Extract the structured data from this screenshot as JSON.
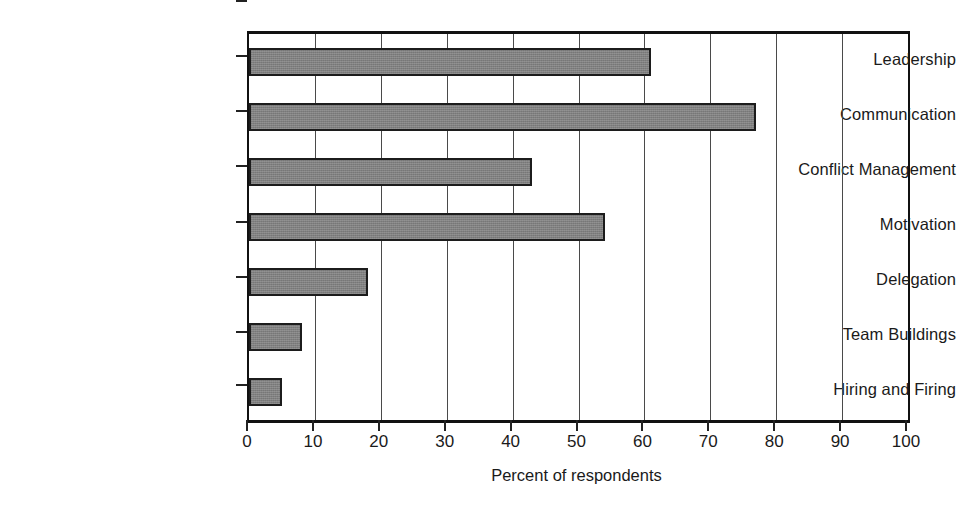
{
  "chart_data": {
    "type": "bar",
    "orientation": "horizontal",
    "title": "",
    "subtitle": "",
    "xlabel": "Percent of respondents",
    "ylabel": "",
    "categories": [
      "Leadership",
      "Communication",
      "Conflict Management",
      "Motivation",
      "Delegation",
      "Team Buildings",
      "Hiring and Firing"
    ],
    "values": [
      61,
      77,
      43,
      54,
      18,
      8,
      5
    ],
    "series": [
      {
        "name": "Percent of respondents",
        "values": [
          61,
          77,
          43,
          54,
          18,
          8,
          5
        ]
      }
    ],
    "xlim": [
      0,
      100
    ],
    "xticks": [
      0,
      10,
      20,
      30,
      40,
      50,
      60,
      70,
      80,
      90,
      100
    ],
    "xticklabels": [
      "0",
      "10",
      "20",
      "30",
      "40",
      "50",
      "60",
      "70",
      "80",
      "90",
      "100"
    ],
    "grid": "vertical",
    "legend": "none",
    "annotations": [],
    "colors": {
      "bar_fill": "#808080",
      "bar_edge": "#1c1c1c",
      "gridline": "#4a4a4a",
      "axis": "#111111",
      "background": "#ffffff",
      "text": "#1a1a1a"
    }
  },
  "axis": {
    "x_title": "Percent of respondents"
  }
}
